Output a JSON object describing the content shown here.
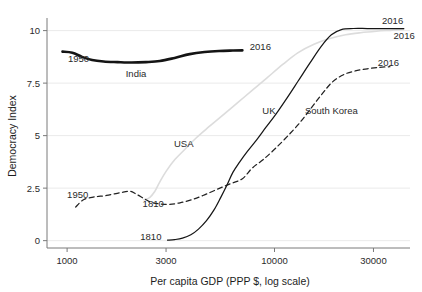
{
  "figure": {
    "faint_top_text": "",
    "background": "#ffffff"
  },
  "chart_data": {
    "type": "line",
    "title": "",
    "xlabel": "Per capita GDP (PPP $, log scale)",
    "ylabel": "Democracy Index",
    "xscale": "log",
    "xlim": [
      800,
      45000
    ],
    "ylim": [
      -0.35,
      10.6
    ],
    "xticks": [
      1000,
      3000,
      10000,
      30000
    ],
    "xticklabels": [
      "1000",
      "3000",
      "10000",
      "30000"
    ],
    "yticks": [
      0,
      2.5,
      5,
      7.5,
      10
    ],
    "yticklabels": [
      "0",
      "2.5",
      "5",
      "7.5",
      "10"
    ],
    "grid": "horizontal-light",
    "legend": "inline-labels",
    "colors": {
      "india": "#141414",
      "uk": "#161616",
      "usa": "#dcdcdc",
      "south_korea": "#222222"
    },
    "series": [
      {
        "name": "India",
        "style": "solid-thick",
        "color": "#141414",
        "start_label": "1950",
        "end_label": "2016",
        "points": [
          [
            950,
            9.0
          ],
          [
            1060,
            8.95
          ],
          [
            1180,
            8.75
          ],
          [
            1320,
            8.6
          ],
          [
            1500,
            8.53
          ],
          [
            1750,
            8.5
          ],
          [
            2050,
            8.48
          ],
          [
            2400,
            8.5
          ],
          [
            2800,
            8.55
          ],
          [
            3300,
            8.7
          ],
          [
            3900,
            8.88
          ],
          [
            4600,
            8.98
          ],
          [
            5400,
            9.03
          ],
          [
            6300,
            9.05
          ],
          [
            7000,
            9.06
          ]
        ]
      },
      {
        "name": "USA",
        "style": "solid-light",
        "color": "#dcdcdc",
        "start_label": "1810",
        "end_label": "2016",
        "points": [
          [
            2350,
            1.95
          ],
          [
            2500,
            2.05
          ],
          [
            2650,
            2.35
          ],
          [
            2800,
            2.8
          ],
          [
            3000,
            3.3
          ],
          [
            3300,
            3.85
          ],
          [
            3700,
            4.35
          ],
          [
            4200,
            4.9
          ],
          [
            4800,
            5.4
          ],
          [
            5600,
            5.95
          ],
          [
            6600,
            6.55
          ],
          [
            7800,
            7.15
          ],
          [
            9200,
            7.75
          ],
          [
            11000,
            8.4
          ],
          [
            13000,
            8.95
          ],
          [
            15500,
            9.35
          ],
          [
            18500,
            9.62
          ],
          [
            22000,
            9.8
          ],
          [
            26000,
            9.9
          ],
          [
            31000,
            9.97
          ],
          [
            37000,
            10.02
          ],
          [
            42000,
            10.06
          ]
        ]
      },
      {
        "name": "UK",
        "style": "solid-thin",
        "color": "#161616",
        "start_label": "1810",
        "end_label": "2016",
        "points": [
          [
            3050,
            0.02
          ],
          [
            3300,
            0.05
          ],
          [
            3600,
            0.12
          ],
          [
            3950,
            0.28
          ],
          [
            4300,
            0.55
          ],
          [
            4700,
            0.95
          ],
          [
            5100,
            1.45
          ],
          [
            5500,
            2.05
          ],
          [
            5900,
            2.65
          ],
          [
            6300,
            3.25
          ],
          [
            6800,
            3.75
          ],
          [
            7400,
            4.25
          ],
          [
            8200,
            4.8
          ],
          [
            9100,
            5.4
          ],
          [
            10200,
            6.05
          ],
          [
            11500,
            6.8
          ],
          [
            13000,
            7.6
          ],
          [
            14800,
            8.45
          ],
          [
            16800,
            9.25
          ],
          [
            18800,
            9.8
          ],
          [
            21000,
            10.05
          ],
          [
            24000,
            10.1
          ],
          [
            28000,
            10.1
          ],
          [
            33000,
            10.1
          ],
          [
            38000,
            10.1
          ],
          [
            42000,
            10.1
          ]
        ]
      },
      {
        "name": "South Korea",
        "style": "dashed",
        "color": "#222222",
        "start_label": "1950",
        "end_label": "2016",
        "points": [
          [
            1100,
            1.6
          ],
          [
            1200,
            1.95
          ],
          [
            1350,
            2.08
          ],
          [
            1550,
            2.15
          ],
          [
            1800,
            2.28
          ],
          [
            2000,
            2.35
          ],
          [
            2150,
            2.22
          ],
          [
            2350,
            2.0
          ],
          [
            2550,
            1.82
          ],
          [
            2800,
            1.75
          ],
          [
            3100,
            1.73
          ],
          [
            3500,
            1.8
          ],
          [
            4000,
            1.95
          ],
          [
            4600,
            2.18
          ],
          [
            5300,
            2.45
          ],
          [
            6100,
            2.7
          ],
          [
            7000,
            2.95
          ],
          [
            7800,
            3.45
          ],
          [
            8800,
            3.85
          ],
          [
            10000,
            4.35
          ],
          [
            11500,
            4.95
          ],
          [
            13200,
            5.6
          ],
          [
            15000,
            6.3
          ],
          [
            17000,
            7.0
          ],
          [
            19000,
            7.55
          ],
          [
            21500,
            7.9
          ],
          [
            24500,
            8.08
          ],
          [
            28000,
            8.18
          ],
          [
            32000,
            8.25
          ],
          [
            36000,
            8.28
          ]
        ]
      }
    ],
    "annotations": [
      {
        "name": "india-start-year",
        "text": "1950",
        "x": 1010,
        "y": 8.52,
        "anchor": "start"
      },
      {
        "name": "india-series-label",
        "text": "India",
        "x": 2150,
        "y": 7.8,
        "anchor": "middle"
      },
      {
        "name": "india-end-year",
        "text": "2016",
        "x": 7600,
        "y": 9.1,
        "anchor": "start"
      },
      {
        "name": "usa-series-label",
        "text": "USA",
        "x": 3650,
        "y": 4.45,
        "anchor": "middle"
      },
      {
        "name": "usa-start-year",
        "text": "1810",
        "x": 2600,
        "y": 1.62,
        "anchor": "middle"
      },
      {
        "name": "usa-end-year",
        "text": "2016",
        "x": 37500,
        "y": 9.62,
        "anchor": "start"
      },
      {
        "name": "uk-series-label",
        "text": "UK",
        "x": 9400,
        "y": 6.05,
        "anchor": "middle"
      },
      {
        "name": "uk-start-year",
        "text": "1810",
        "x": 2850,
        "y": 0.05,
        "anchor": "end"
      },
      {
        "name": "uk-end-year",
        "text": "2016",
        "x": 33000,
        "y": 10.3,
        "anchor": "start"
      },
      {
        "name": "korea-start-year",
        "text": "1950",
        "x": 1000,
        "y": 2.02,
        "anchor": "start"
      },
      {
        "name": "korea-series-label",
        "text": "South Korea",
        "x": 18800,
        "y": 6.05,
        "anchor": "middle"
      },
      {
        "name": "korea-end-year",
        "text": "2016",
        "x": 31500,
        "y": 8.33,
        "anchor": "start"
      }
    ]
  }
}
